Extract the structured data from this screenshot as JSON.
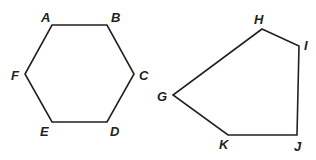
{
  "figures": [
    {
      "name": "hexagon",
      "vertices": [
        {
          "label": "A",
          "x": 52,
          "y": 25,
          "lx": 41,
          "ly": 22
        },
        {
          "label": "B",
          "x": 107,
          "y": 25,
          "lx": 111,
          "ly": 22
        },
        {
          "label": "C",
          "x": 134,
          "y": 74,
          "lx": 139,
          "ly": 80
        },
        {
          "label": "D",
          "x": 107,
          "y": 122,
          "lx": 110,
          "ly": 136
        },
        {
          "label": "E",
          "x": 52,
          "y": 122,
          "lx": 40,
          "ly": 136
        },
        {
          "label": "F",
          "x": 25,
          "y": 74,
          "lx": 11,
          "ly": 80
        }
      ]
    },
    {
      "name": "pentagon",
      "vertices": [
        {
          "label": "H",
          "x": 262,
          "y": 29,
          "lx": 254,
          "ly": 24
        },
        {
          "label": "I",
          "x": 299,
          "y": 46,
          "lx": 304,
          "ly": 50
        },
        {
          "label": "J",
          "x": 297,
          "y": 135,
          "lx": 294,
          "ly": 151
        },
        {
          "label": "K",
          "x": 228,
          "y": 135,
          "lx": 219,
          "ly": 149
        },
        {
          "label": "G",
          "x": 173,
          "y": 95,
          "lx": 157,
          "ly": 101
        }
      ]
    }
  ],
  "colors": {
    "stroke": "#231f20",
    "label": "#231f20",
    "background": "#ffffff"
  }
}
